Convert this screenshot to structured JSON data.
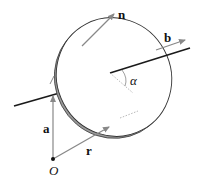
{
  "diagram": {
    "labels": {
      "n": "n",
      "b": "b",
      "alpha": "α",
      "a": "a",
      "r": "r",
      "origin": "O"
    },
    "colors": {
      "axis": "#1a1a1a",
      "vector": "#888888",
      "disk_edge": "#333333",
      "disk_rim": "#9a9a9a"
    }
  }
}
